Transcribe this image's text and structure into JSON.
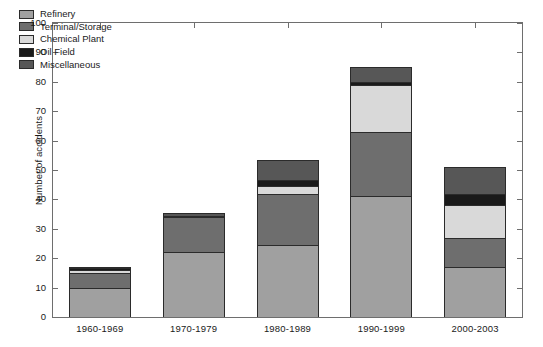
{
  "chart_data": {
    "type": "bar",
    "subtype": "stacked-bar",
    "title": "",
    "xlabel": "",
    "ylabel": "Number of accidents",
    "categories": [
      "1960-1969",
      "1970-1979",
      "1980-1989",
      "1990-1999",
      "2000-2003"
    ],
    "series": [
      {
        "name": "Refinery",
        "color": "#a0a0a0",
        "values": [
          10,
          22,
          24.5,
          41,
          17
        ]
      },
      {
        "name": "Terminal/Storage",
        "color": "#6e6e6e",
        "values": [
          5,
          12,
          17.5,
          22,
          10
        ]
      },
      {
        "name": "Chemical Plant",
        "color": "#d9d9d9",
        "values": [
          1,
          0,
          2.5,
          16,
          11
        ]
      },
      {
        "name": "Oil Field",
        "color": "#1a1a1a",
        "values": [
          0.5,
          0.5,
          2,
          1,
          4
        ]
      },
      {
        "name": "Miscellaneous",
        "color": "#575757",
        "values": [
          0.5,
          1,
          7,
          5,
          9
        ]
      }
    ],
    "totals": [
      17,
      35.5,
      53,
      85,
      51
    ],
    "ylim": [
      0,
      100
    ],
    "yticks": [
      0,
      10,
      20,
      30,
      40,
      50,
      60,
      70,
      80,
      90,
      100
    ],
    "ytick_labels": [
      "0",
      "10",
      "20",
      "30",
      "40",
      "50",
      "60",
      "70",
      "80",
      "90",
      "100"
    ],
    "grid": false,
    "legend_position": "upper-left",
    "legend_entries": [
      "Refinery",
      "Terminal/Storage",
      "Chemical Plant",
      "Oil Field",
      "Miscellaneous"
    ]
  }
}
